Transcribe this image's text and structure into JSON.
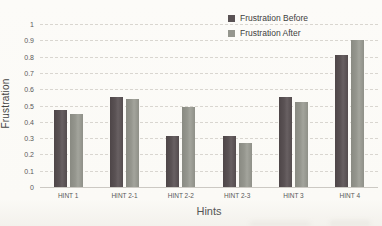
{
  "chart_data": {
    "type": "bar",
    "title": "",
    "xlabel": "Hints",
    "ylabel": "Frustration",
    "categories": [
      "HINT 1",
      "HINT 2-1",
      "HINT 2-2",
      "HINT 2-3",
      "HINT 3",
      "HINT 4"
    ],
    "series": [
      {
        "name": "Frustration Before",
        "color": "#5a5254",
        "values": [
          0.47,
          0.55,
          0.31,
          0.31,
          0.55,
          0.81
        ]
      },
      {
        "name": "Frustration After",
        "color": "#95968e",
        "values": [
          0.45,
          0.54,
          0.49,
          0.27,
          0.52,
          0.9
        ]
      }
    ],
    "ylim": [
      0,
      1
    ],
    "ytick_step": 0.1,
    "ytick_labels": [
      "0",
      "0.1",
      "0.2",
      "0.3",
      "0.4",
      "0.5",
      "0.6",
      "0.7",
      "0.8",
      "0.9",
      "1"
    ],
    "grid": true,
    "legend_position": "top-right"
  },
  "colors": {
    "background": "#fbfaf6",
    "gridline": "#d9d6d0",
    "axis_text": "#595959",
    "bar_before": "#5a5254",
    "bar_after": "#95968e"
  }
}
